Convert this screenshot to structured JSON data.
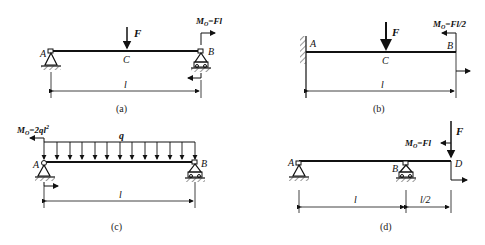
{
  "figures": {
    "a": {
      "caption": "(a)",
      "A": "A",
      "B": "B",
      "C": "C",
      "F": "F",
      "moment_label": "M",
      "moment_sub": "O",
      "moment_value": "=Fl",
      "length": "l"
    },
    "b": {
      "caption": "(b)",
      "A": "A",
      "B": "B",
      "C": "C",
      "F": "F",
      "moment_label": "M",
      "moment_sub": "O",
      "moment_value": "=Fl/2",
      "length": "l"
    },
    "c": {
      "caption": "(c)",
      "A": "A",
      "B": "B",
      "q": "q",
      "moment_label": "M",
      "moment_sub": "O",
      "moment_value": "=2ql",
      "moment_exp": "2",
      "length": "l"
    },
    "d": {
      "caption": "(d)",
      "A": "A",
      "B": "B",
      "D": "D",
      "F": "F",
      "moment_label": "M",
      "moment_sub": "O",
      "moment_value": "=Fl",
      "length_AB": "l",
      "length_BD": "l/2"
    }
  }
}
